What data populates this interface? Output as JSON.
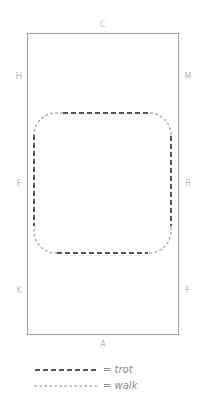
{
  "diagram": {
    "type": "dressage-arena-figure",
    "arena": {
      "border_color": "#9a9a9a",
      "letters": {
        "top": "C",
        "bottom": "A",
        "left": [
          "H",
          "E",
          "K"
        ],
        "right": [
          "M",
          "B",
          "F"
        ]
      }
    },
    "figure": {
      "shape": "rounded-rectangle",
      "segments": [
        {
          "gait": "trot",
          "style": "dashed",
          "color": "#555555"
        },
        {
          "gait": "walk",
          "style": "dotted",
          "color": "#aaaaaa"
        }
      ]
    },
    "legend": [
      {
        "symbol": "dashed",
        "label": "= trot",
        "color": "#555555"
      },
      {
        "symbol": "dotted",
        "label": "= walk",
        "color": "#aaaaaa"
      }
    ]
  }
}
